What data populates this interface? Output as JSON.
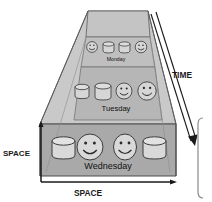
{
  "figure": {
    "colors": {
      "background": "#ffffff",
      "box_top_face": "#c9c9c9",
      "box_back_panel": "#c2c2c2",
      "band_monday": "#bdbdbd",
      "band_tuesday": "#b5b5b5",
      "band_wednesday": "#a8a8a8",
      "outline": "#4d4d4d",
      "shape_fill": "#d4d4d4",
      "shape_outline": "#3c3c3c",
      "axis": "#1a1a1a",
      "bracket": "#8a8a8a",
      "text": "#111111"
    },
    "axes": {
      "vertical_label": "SPACE",
      "horizontal_label": "SPACE",
      "depth_label": "TIME"
    },
    "layers": [
      {
        "day": "Monday",
        "depth": "back",
        "items": [
          {
            "kind": "smiley-face",
            "name": "smiley-face-icon"
          },
          {
            "kind": "database-cylinder",
            "name": "database-cylinder-icon"
          },
          {
            "kind": "database-cylinder",
            "name": "database-cylinder-icon"
          },
          {
            "kind": "smiley-face",
            "name": "smiley-face-icon"
          }
        ]
      },
      {
        "day": "Tuesday",
        "depth": "middle",
        "items": [
          {
            "kind": "database-cylinder",
            "name": "database-cylinder-icon"
          },
          {
            "kind": "database-cylinder",
            "name": "database-cylinder-icon"
          },
          {
            "kind": "smiley-face",
            "name": "smiley-face-icon"
          },
          {
            "kind": "smiley-face",
            "name": "smiley-face-icon"
          }
        ]
      },
      {
        "day": "Wednesday",
        "depth": "front",
        "items": [
          {
            "kind": "database-cylinder",
            "name": "database-cylinder-icon"
          },
          {
            "kind": "smiley-face",
            "name": "smiley-face-icon"
          },
          {
            "kind": "smiley-face",
            "name": "smiley-face-icon"
          },
          {
            "kind": "database-cylinder",
            "name": "database-cylinder-icon"
          }
        ]
      }
    ],
    "bracket": {
      "position": "right",
      "label": ""
    }
  }
}
